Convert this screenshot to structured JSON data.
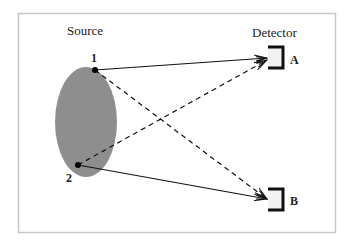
{
  "figure": {
    "labels": {
      "source": "Source",
      "detector": "Detector",
      "point_1": "1",
      "point_2": "2",
      "detector_a": "A",
      "detector_b": "B"
    },
    "colors": {
      "frame": "#c8c8c8",
      "source_fill": "#8e8e8e",
      "line": "#111111",
      "bracket": "#111111"
    },
    "paths": [
      {
        "from": "1",
        "to": "A",
        "style": "solid"
      },
      {
        "from": "1",
        "to": "B",
        "style": "dashed"
      },
      {
        "from": "2",
        "to": "A",
        "style": "dashed"
      },
      {
        "from": "2",
        "to": "B",
        "style": "solid"
      }
    ]
  }
}
